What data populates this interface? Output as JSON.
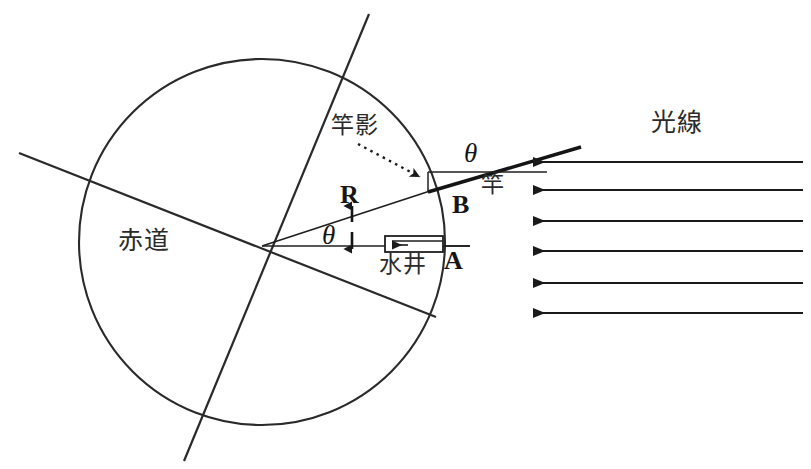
{
  "figure": {
    "width": 811,
    "height": 469,
    "background": "#ffffff",
    "stroke_color": "#1a1a1a",
    "text_color": "#151515"
  },
  "labels": {
    "equator": "赤道",
    "pole_shadow": "竿影",
    "light_rays": "光線",
    "pole": "竿",
    "water_well": "水井",
    "radius": "R",
    "point_a": "A",
    "point_b": "B",
    "angle_center": "θ",
    "angle_pole": "θ"
  },
  "geometry": {
    "earth_circle": {
      "cx": 262,
      "cy": 242,
      "r": 183
    },
    "equator_line": {
      "x1": 19,
      "y1": 153,
      "x2": 436,
      "y2": 317
    },
    "axis_line": {
      "x1": 369,
      "y1": 14,
      "x2": 184,
      "y2": 461
    },
    "well_radius_line": {
      "x1": 262,
      "y1": 246,
      "x2": 470,
      "y2": 246
    },
    "pole_radius_line": {
      "x1": 262,
      "y1": 246,
      "x2": 580,
      "y2": 148
    },
    "pole_segment": {
      "x1": 430,
      "y1": 189,
      "x2": 580,
      "y2": 148
    },
    "shadow_segment": {
      "x1": 430,
      "y1": 172,
      "x2": 545,
      "y2": 172
    },
    "well_rect": {
      "x": 385,
      "y": 236,
      "w": 58,
      "h": 16
    },
    "center_arrow": {
      "x": 352,
      "y1": 206,
      "y2": 249
    },
    "shadow_pointer": {
      "x1": 360,
      "y1": 145,
      "x2": 422,
      "y2": 176
    }
  },
  "light_rays": {
    "direction": "right-to-left",
    "count": 6,
    "tip_x": 533,
    "tail_x": 803,
    "y_positions": [
      162,
      190,
      221,
      251,
      283,
      313
    ]
  }
}
